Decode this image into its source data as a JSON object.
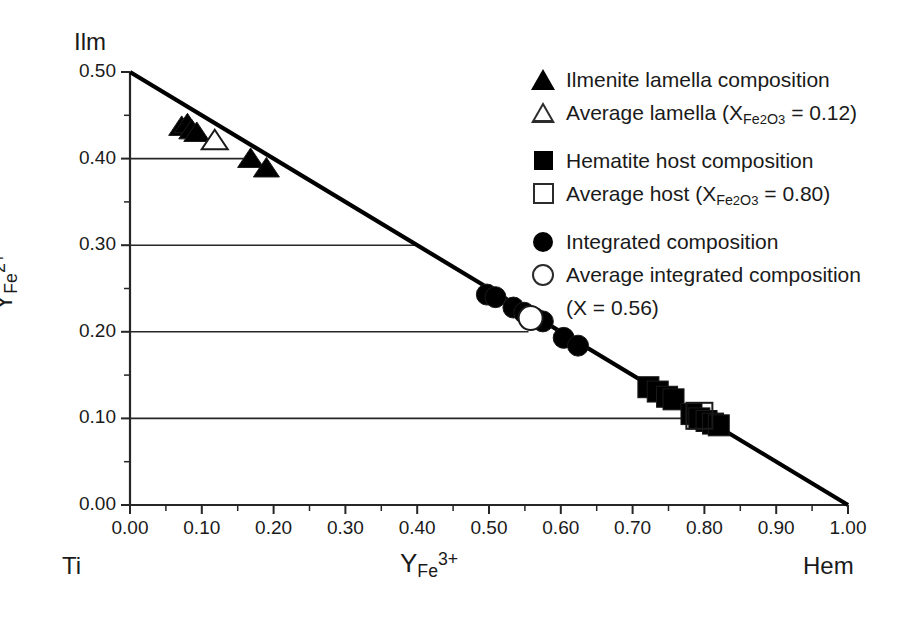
{
  "figure": {
    "corner_labels": {
      "top_left": "Ilm",
      "bottom_left": "Ti",
      "bottom_right": "Hem"
    },
    "axes": {
      "x": {
        "label_base": "Y",
        "label_sub": "Fe",
        "label_sup": "3+",
        "min": 0.0,
        "max": 1.0,
        "major_step": 0.1,
        "minor_step": 0.05,
        "ticks": [
          "0.00",
          "0.10",
          "0.20",
          "0.30",
          "0.40",
          "0.50",
          "0.60",
          "0.70",
          "0.80",
          "0.90",
          "1.00"
        ]
      },
      "y": {
        "label_base": "Y",
        "label_sub": "Fe",
        "label_sup": "2+",
        "min": 0.0,
        "max": 0.5,
        "major_step": 0.1,
        "minor_step": 0.05,
        "ticks": [
          "0.00",
          "0.10",
          "0.20",
          "0.30",
          "0.40",
          "0.50"
        ]
      }
    },
    "legend": {
      "items": [
        {
          "symbol": "filled-triangle",
          "text": "Ilmenite lamella composition",
          "group": 1
        },
        {
          "symbol": "open-triangle",
          "text": "Average lamella (X",
          "sub": "Fe",
          "sub2": "2",
          "sub3": "O",
          "sub4": "3",
          "tail": " = 0.12)",
          "group": 1
        },
        {
          "symbol": "filled-square",
          "text": "Hematite host composition",
          "group": 2
        },
        {
          "symbol": "open-square",
          "text": "Average host (X",
          "sub": "Fe",
          "sub2": "2",
          "sub3": "O",
          "sub4": "3",
          "tail": " = 0.80)",
          "group": 2
        },
        {
          "symbol": "filled-circle",
          "text": "Integrated composition",
          "group": 3
        },
        {
          "symbol": "open-circle",
          "text": "Average integrated composition",
          "continuation": "(X",
          "cont_tail": " = 0.56)",
          "group": 3
        }
      ]
    }
  },
  "chart_data": {
    "type": "scatter",
    "title": "",
    "xlabel": "Y_Fe3+",
    "ylabel": "Y_Fe2+",
    "xlim": [
      0.0,
      1.0
    ],
    "ylim": [
      0.0,
      0.5
    ],
    "grid": false,
    "legend_position": "upper-right-outside",
    "reference_line": {
      "name": "Ilm-Hem join",
      "from": [
        0.0,
        0.5
      ],
      "to": [
        1.0,
        0.0
      ],
      "equation": "Y_Fe2+ = 0.5 * (1 - Y_Fe3+)"
    },
    "horizontal_guide_lines": [
      {
        "y": 0.4,
        "x_start": 0.0,
        "x_end": 0.17
      },
      {
        "y": 0.3,
        "x_start": 0.0,
        "x_end": 0.4
      },
      {
        "y": 0.2,
        "x_start": 0.0,
        "x_end": 0.555
      },
      {
        "y": 0.1,
        "x_start": 0.0,
        "x_end": 0.795
      }
    ],
    "series": [
      {
        "name": "Ilmenite lamella composition",
        "marker": "filled-triangle",
        "points": [
          [
            0.072,
            0.437
          ],
          [
            0.08,
            0.44
          ],
          [
            0.086,
            0.433
          ],
          [
            0.093,
            0.43
          ],
          [
            0.168,
            0.4
          ],
          [
            0.19,
            0.389
          ]
        ]
      },
      {
        "name": "Average lamella",
        "marker": "open-triangle",
        "x_fe2o3": 0.12,
        "points": [
          [
            0.118,
            0.421
          ]
        ]
      },
      {
        "name": "Hematite host composition",
        "marker": "filled-square",
        "points": [
          [
            0.722,
            0.136
          ],
          [
            0.735,
            0.131
          ],
          [
            0.748,
            0.125
          ],
          [
            0.757,
            0.122
          ],
          [
            0.782,
            0.105
          ],
          [
            0.793,
            0.1
          ],
          [
            0.803,
            0.097
          ],
          [
            0.812,
            0.094
          ],
          [
            0.82,
            0.092
          ]
        ]
      },
      {
        "name": "Average host",
        "marker": "open-square",
        "x_fe2o3": 0.8,
        "points": [
          [
            0.793,
            0.103
          ]
        ]
      },
      {
        "name": "Integrated composition",
        "marker": "filled-circle",
        "points": [
          [
            0.497,
            0.243
          ],
          [
            0.509,
            0.24
          ],
          [
            0.534,
            0.228
          ],
          [
            0.549,
            0.222
          ],
          [
            0.565,
            0.215
          ],
          [
            0.575,
            0.212
          ],
          [
            0.604,
            0.193
          ],
          [
            0.624,
            0.184
          ]
        ]
      },
      {
        "name": "Average integrated composition",
        "marker": "open-circle",
        "x_fe2o3": 0.56,
        "points": [
          [
            0.558,
            0.216
          ]
        ]
      }
    ]
  }
}
